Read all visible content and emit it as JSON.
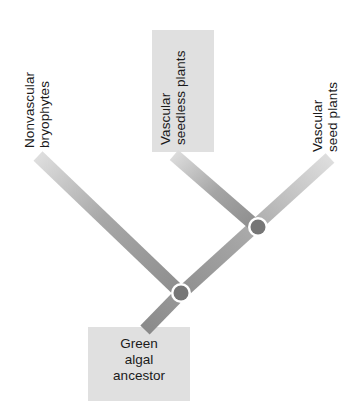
{
  "figure": {
    "type": "cladogram",
    "title": "",
    "background_color": "#ffffff",
    "branch_color_light": "#d9d9d9",
    "branch_color_dark": "#8f8f8f",
    "node_fill_color": "#767676",
    "node_ring_color": "#ffffff",
    "highlight_box_color": "#e0e0e0",
    "text_color": "#1a1a1a"
  },
  "tips": [
    {
      "id": "nonvascular-bryophytes",
      "line1": "Nonvascular",
      "line2": "bryophytes",
      "highlighted": false
    },
    {
      "id": "vascular-seedless-plants",
      "line1": "Vascular",
      "line2": "seedless plants",
      "highlighted": true
    },
    {
      "id": "vascular-seed-plants",
      "line1": "Vascular",
      "line2": "seed plants",
      "highlighted": false
    }
  ],
  "root": {
    "id": "green-algal-ancestor",
    "line1": "Green",
    "line2": "algal",
    "line3": "ancestor",
    "highlighted": true
  },
  "nodes": [
    {
      "id": "node-basal",
      "label": ""
    },
    {
      "id": "node-vascular",
      "label": ""
    }
  ]
}
